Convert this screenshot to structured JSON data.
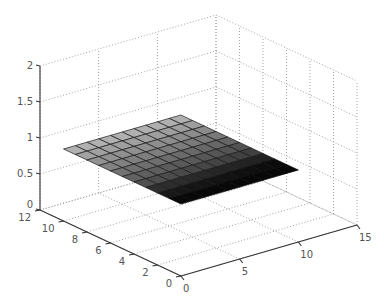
{
  "chart_data": {
    "type": "surface3d",
    "title": "",
    "xlabel": "",
    "ylabel": "",
    "zlabel": "",
    "x_ticks": [
      0,
      2,
      4,
      6,
      8,
      10,
      12
    ],
    "y_ticks": [
      0,
      5,
      10,
      15
    ],
    "z_ticks": [
      0,
      0.5,
      1,
      1.5,
      2
    ],
    "xlim": [
      0,
      12
    ],
    "ylim": [
      0,
      15
    ],
    "zlim": [
      0,
      2
    ],
    "grid": true,
    "colormap": "gray",
    "surface": {
      "description": "Nearly flat planar surface at z ≈ 1 over a 10x10 mesh, shaded light gray (back) to black (front)",
      "x_range": [
        0,
        10
      ],
      "y_range": [
        0,
        10
      ],
      "z_value": 1,
      "mesh_cells": 10
    }
  },
  "labels": {
    "x_ticks": [
      "0",
      "2",
      "4",
      "6",
      "8",
      "10",
      "12"
    ],
    "y_ticks": [
      "0",
      "5",
      "10",
      "15"
    ],
    "z_ticks": [
      "0",
      "0.5",
      "1",
      "1.5",
      "2"
    ]
  }
}
